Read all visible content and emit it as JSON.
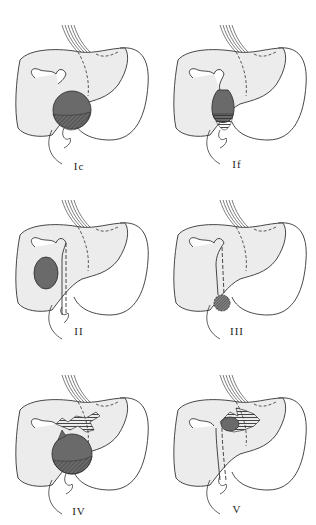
{
  "figure": {
    "colors": {
      "liver_fill": "#ececec",
      "outline": "#333333",
      "cyst_dark": "#555555",
      "background": "#ffffff"
    },
    "panels": [
      {
        "id": "Ic",
        "label": "Ic",
        "cyst": "large spherical dilatation of common bile duct, dark shading with hatched lower portion"
      },
      {
        "id": "If",
        "label": "If",
        "cyst": "fusiform dilatation of common bile duct, dark shading with hatched lower portion"
      },
      {
        "id": "II",
        "label": "II",
        "cyst": "diverticulum of extrahepatic bile duct"
      },
      {
        "id": "III",
        "label": "III",
        "cyst": "choledochocele at distal duct"
      },
      {
        "id": "IV",
        "label": "IV",
        "cyst": "large extrahepatic cyst with intrahepatic hatched dilatations"
      },
      {
        "id": "V",
        "label": "V",
        "cyst": "intrahepatic cysts only (hatched) with small dark central dilatation"
      }
    ]
  }
}
